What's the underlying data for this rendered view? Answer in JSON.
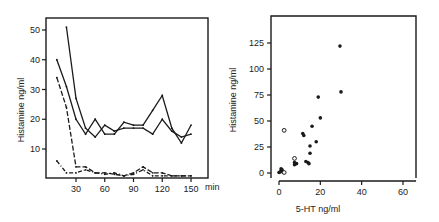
{
  "chart_data": [
    {
      "type": "line",
      "title": "",
      "xlabel": "min",
      "ylabel": "Histamine ng/ml",
      "xlim": [
        5,
        160
      ],
      "ylim": [
        0,
        55
      ],
      "x_ticks": [
        30,
        60,
        90,
        120,
        150
      ],
      "y_ticks": [
        10,
        20,
        30,
        40,
        50
      ],
      "grid": false,
      "legend": null,
      "x": [
        10,
        20,
        30,
        40,
        50,
        60,
        70,
        80,
        90,
        100,
        110,
        120,
        130,
        140,
        150
      ],
      "series": [
        {
          "name": "Subject A (solid, highest start)",
          "style": "solid",
          "values": [
            null,
            51,
            27,
            17,
            14,
            18,
            16,
            17,
            17,
            17,
            15,
            20,
            16,
            14,
            15
          ]
        },
        {
          "name": "Subject B",
          "style": "solid",
          "values": [
            40,
            31,
            20,
            15,
            20,
            15,
            15,
            19,
            18,
            18,
            23,
            28,
            17,
            12,
            18
          ]
        },
        {
          "name": "Subject C",
          "style": "dashed",
          "values": [
            34,
            24,
            4,
            4,
            2,
            2,
            1.5,
            1,
            2,
            4,
            2,
            2,
            1,
            1,
            1
          ]
        },
        {
          "name": "Subject D",
          "style": "dash-dot",
          "values": [
            6,
            2,
            2,
            3,
            2,
            1.5,
            2,
            1,
            1.5,
            3,
            1,
            1,
            1,
            1,
            1
          ]
        }
      ]
    },
    {
      "type": "scatter",
      "title": "",
      "xlabel": "5-HT ng/ml",
      "ylabel": "Histamine ng/ml",
      "xlim": [
        -4,
        66
      ],
      "ylim": [
        0,
        145
      ],
      "x_ticks": [
        0,
        20,
        40,
        60
      ],
      "y_ticks": [
        0,
        25,
        50,
        75,
        100,
        125
      ],
      "grid": false,
      "legend": null,
      "series": [
        {
          "name": "filled",
          "marker": "filled-circle",
          "points": [
            [
              29.5,
              122
            ],
            [
              30,
              78
            ],
            [
              19,
              73
            ],
            [
              20,
              53
            ],
            [
              16,
              45
            ],
            [
              11.5,
              38
            ],
            [
              12,
              36
            ],
            [
              18,
              30
            ],
            [
              15,
              26
            ],
            [
              15,
              19
            ],
            [
              13,
              11
            ],
            [
              14,
              10
            ],
            [
              14.5,
              9
            ],
            [
              7.5,
              8
            ],
            [
              8.5,
              9
            ],
            [
              7.5,
              10
            ],
            [
              1,
              2
            ],
            [
              0.5,
              1
            ],
            [
              1.5,
              3
            ],
            [
              2,
              1
            ],
            [
              0,
              0.5
            ],
            [
              1,
              4
            ]
          ]
        },
        {
          "name": "open",
          "marker": "open-circle",
          "points": [
            [
              2.5,
              41
            ],
            [
              7.5,
              14
            ],
            [
              2.5,
              0.5
            ]
          ]
        }
      ]
    }
  ],
  "labels": {
    "left_ylabel": "Histamine ng/ml",
    "left_xunit": "min",
    "right_ylabel": "Histamine ng/ml",
    "right_xlabel": "5-HT ng/ml"
  }
}
